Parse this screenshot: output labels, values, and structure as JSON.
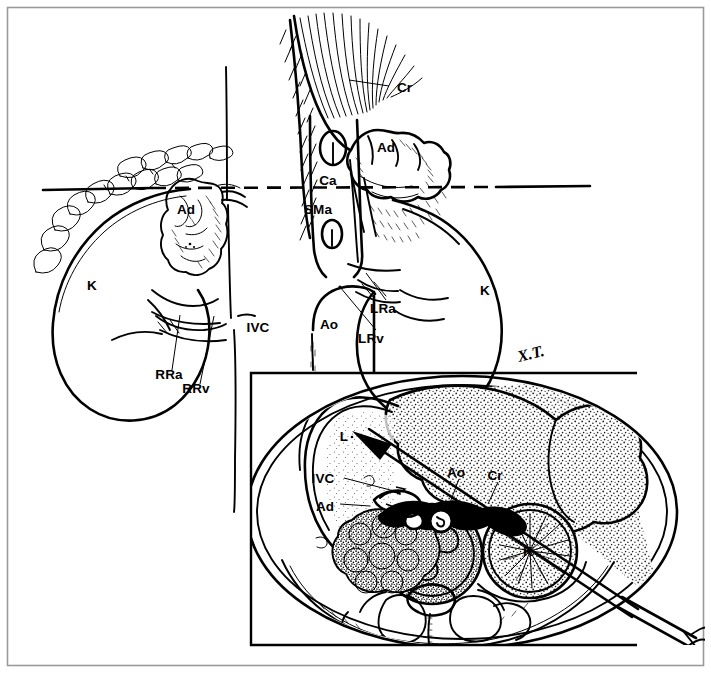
{
  "figure": {
    "artist_signature": "X.T.",
    "background_color": "#ffffff",
    "ink_color": "#000000",
    "frame_color": "#9a9a9a"
  },
  "upper_panel": {
    "description": "Coronal/frontal view of both kidneys, adrenal glands, crura, aorta and inferior vena cava with a dashed transverse section line",
    "section_line": {
      "style": "dashed",
      "orientation": "horizontal",
      "note": "indicates level of the transverse section shown in the inset"
    },
    "labels": [
      {
        "id": "ad-left",
        "text": "Ad",
        "meaning": "adrenal gland (left side of image)",
        "x": 186,
        "y": 214
      },
      {
        "id": "k-left",
        "text": "K",
        "meaning": "kidney (left side of image)",
        "x": 92,
        "y": 290
      },
      {
        "id": "rra",
        "text": "RRa",
        "meaning": "right renal artery",
        "x": 169,
        "y": 379
      },
      {
        "id": "rrv",
        "text": "RRv",
        "meaning": "right renal vein",
        "x": 196,
        "y": 393
      },
      {
        "id": "ivc",
        "text": "IVC",
        "meaning": "inferior vena cava",
        "x": 258,
        "y": 332
      },
      {
        "id": "ao-upper",
        "text": "Ao",
        "meaning": "aorta",
        "x": 329,
        "y": 329
      },
      {
        "id": "cr-upper",
        "text": "Cr",
        "meaning": "diaphragmatic crus",
        "x": 397,
        "y": 87
      },
      {
        "id": "ad-right",
        "text": "Ad",
        "meaning": "adrenal gland (right side of image)",
        "x": 386,
        "y": 147
      },
      {
        "id": "ca",
        "text": "Ca",
        "meaning": "celiac axis / coeliac artery",
        "x": 328,
        "y": 180
      },
      {
        "id": "sma",
        "text": "SMa",
        "meaning": "superior mesenteric artery",
        "x": 318,
        "y": 209
      },
      {
        "id": "lra",
        "text": "LRa",
        "meaning": "left renal artery",
        "x": 383,
        "y": 308
      },
      {
        "id": "lrv",
        "text": "LRv",
        "meaning": "left renal vein",
        "x": 371,
        "y": 338
      },
      {
        "id": "k-right",
        "text": "K",
        "meaning": "kidney (right side of image)",
        "x": 485,
        "y": 290
      }
    ]
  },
  "inset_panel": {
    "description": "Transverse (axial) CT-style cross-section of the upper abdomen with stippled ultrasound sector and a biopsy needle directed toward the adrenal region",
    "labels": [
      {
        "id": "l-inset",
        "text": "L",
        "meaning": "liver",
        "x": 344,
        "y": 437
      },
      {
        "id": "ivc-inset",
        "text": "IVC",
        "meaning": "inferior vena cava",
        "x": 323,
        "y": 479
      },
      {
        "id": "ad-inset",
        "text": "Ad",
        "meaning": "adrenal gland",
        "x": 325,
        "y": 507
      },
      {
        "id": "ao-inset",
        "text": "Ao",
        "meaning": "aorta",
        "x": 456,
        "y": 473
      },
      {
        "id": "cr-inset",
        "text": "Cr",
        "meaning": "diaphragmatic crus",
        "x": 495,
        "y": 476
      },
      {
        "id": "k-inset",
        "text": "K",
        "meaning": "kidney",
        "x": 528,
        "y": 551
      }
    ],
    "needle": {
      "description": "long straight biopsy needle entering posterolaterally, tip in adrenal area",
      "visible": true
    },
    "ultrasound_sector": {
      "description": "stippled fan-shaped ultrasound beam from transducer at the needle entry",
      "visible": true
    }
  },
  "abbreviation_key": [
    {
      "abbr": "Ad",
      "term": "Adrenal gland"
    },
    {
      "abbr": "K",
      "term": "Kidney"
    },
    {
      "abbr": "Cr",
      "term": "Crus of diaphragm"
    },
    {
      "abbr": "Ca",
      "term": "Celiac axis"
    },
    {
      "abbr": "SMa",
      "term": "Superior mesenteric artery"
    },
    {
      "abbr": "Ao",
      "term": "Aorta"
    },
    {
      "abbr": "IVC",
      "term": "Inferior vena cava"
    },
    {
      "abbr": "RRa",
      "term": "Right renal artery"
    },
    {
      "abbr": "RRv",
      "term": "Right renal vein"
    },
    {
      "abbr": "LRa",
      "term": "Left renal artery"
    },
    {
      "abbr": "LRv",
      "term": "Left renal vein"
    },
    {
      "abbr": "L",
      "term": "Liver"
    }
  ]
}
